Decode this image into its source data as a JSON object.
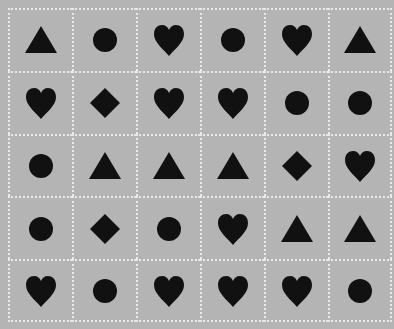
{
  "board": {
    "rows": 5,
    "cols": 6,
    "colors": {
      "background": "#b4b4b4",
      "grid_line": "#eaeaea",
      "shape": "#111111"
    },
    "cells": [
      [
        "triangle",
        "circle",
        "heart",
        "circle",
        "heart",
        "triangle"
      ],
      [
        "heart",
        "diamond",
        "heart",
        "heart",
        "circle",
        "circle"
      ],
      [
        "circle",
        "triangle",
        "triangle",
        "triangle",
        "diamond",
        "heart"
      ],
      [
        "circle",
        "diamond",
        "circle",
        "heart",
        "triangle",
        "triangle"
      ],
      [
        "heart",
        "circle",
        "heart",
        "heart",
        "heart",
        "circle"
      ]
    ]
  }
}
